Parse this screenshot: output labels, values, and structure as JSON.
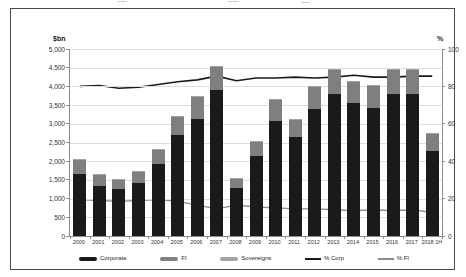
{
  "figure": {
    "left_axis_title": "$bn",
    "right_axis_title": "%"
  },
  "chart_data": {
    "type": "bar",
    "subtype": "stacked-bar-with-lines",
    "stacked": true,
    "grid": true,
    "legend_position": "bottom",
    "categories": [
      "2000",
      "2001",
      "2002",
      "2003",
      "2004",
      "2005",
      "2006",
      "2007",
      "2008",
      "2009",
      "2010",
      "2011",
      "2012",
      "2013",
      "2014",
      "2015",
      "2016",
      "2017",
      "2018 1H"
    ],
    "bar_series": [
      {
        "name": "Corporate",
        "color": "#1a1a1a",
        "values": [
          1650,
          1340,
          1260,
          1430,
          1920,
          2700,
          3120,
          3900,
          1290,
          2140,
          3080,
          2650,
          3390,
          3790,
          3565,
          3430,
          3790,
          3790,
          2280
        ]
      },
      {
        "name": "FI",
        "color": "#7f7f7f",
        "values": [
          400,
          310,
          260,
          300,
          400,
          500,
          600,
          625,
          260,
          390,
          560,
          460,
          600,
          640,
          560,
          580,
          640,
          655,
          470
        ]
      },
      {
        "name": "Sovereigns",
        "color": "#a3a3a3",
        "values": [
          10,
          10,
          10,
          10,
          10,
          15,
          20,
          20,
          10,
          10,
          15,
          10,
          20,
          25,
          20,
          20,
          25,
          30,
          10
        ]
      }
    ],
    "line_series": [
      {
        "name": "% Corp",
        "color": "#1a1a1a",
        "axis": "right",
        "width": 1.6,
        "values": [
          80,
          80.5,
          79,
          79.5,
          81,
          82.5,
          83.5,
          85.5,
          83,
          84.5,
          84.5,
          85,
          84.5,
          85,
          86,
          85,
          85,
          85.5,
          85.5
        ]
      },
      {
        "name": "% FI",
        "color": "#8c8c8c",
        "axis": "right",
        "width": 1.4,
        "values": [
          19.5,
          19,
          18.5,
          19,
          19.5,
          18.5,
          16.5,
          14.5,
          16.5,
          15.5,
          15,
          14.5,
          14.5,
          14,
          13.5,
          14,
          13.5,
          14,
          12.5
        ]
      }
    ],
    "left_axis": {
      "title": "$bn",
      "min": 0,
      "max": 5000,
      "tick_step": 500,
      "tick_labels": [
        "5,000",
        "4,500",
        "4,000",
        "3,500",
        "3,000",
        "2,500",
        "2,000",
        "1,500",
        "1,000",
        "500",
        "0"
      ]
    },
    "right_axis": {
      "title": "%",
      "min": 0,
      "max": 100,
      "tick_step": 20,
      "tick_labels": [
        "100",
        "80",
        "60",
        "40",
        "20",
        "0"
      ]
    }
  }
}
